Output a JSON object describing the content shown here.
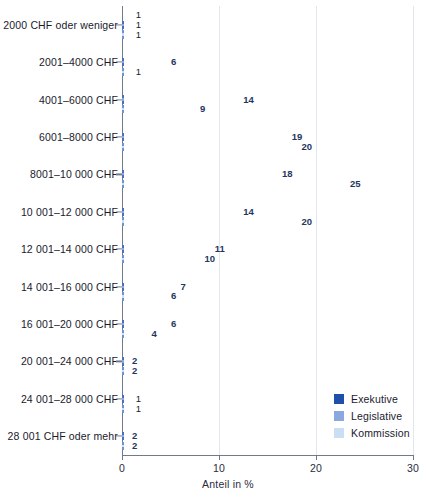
{
  "chart_data": {
    "type": "bar",
    "orientation": "horizontal",
    "title": "",
    "xlabel": "Anteil in %",
    "ylabel": "",
    "xlim": [
      0,
      30
    ],
    "xticks": [
      0,
      10,
      20,
      30
    ],
    "xtick_labels": [
      "0",
      "10",
      "20",
      "30"
    ],
    "grid": true,
    "legend_position": "bottom-right",
    "categories": [
      "2000 CHF oder weniger",
      "2001–4000 CHF",
      "4001–6000 CHF",
      "6001–8000 CHF",
      "8001–10 000 CHF",
      "10 001–12 000 CHF",
      "12 001–14 000 CHF",
      "14 001–16 000 CHF",
      "16 001–20 000 CHF",
      "20 001–24 000 CHF",
      "24 001–28 000 CHF",
      "28 001 CHF oder mehr"
    ],
    "series": [
      {
        "name": "Exekutive",
        "color": "#1f4fa8",
        "values": [
          1,
          2,
          10,
          14,
          23,
          20,
          10,
          8,
          7,
          2,
          2,
          3
        ]
      },
      {
        "name": "Legislative",
        "color": "#8aa8de",
        "values": [
          1,
          6,
          14,
          19,
          18,
          14,
          11,
          7,
          6,
          2,
          1,
          2
        ]
      },
      {
        "name": "Kommission",
        "color": "#cbdff4",
        "values": [
          1,
          1,
          9,
          20,
          25,
          20,
          10,
          6,
          4,
          2,
          1,
          2
        ]
      }
    ]
  },
  "legend": {
    "items": [
      {
        "label": "Exekutive",
        "color": "#1f4fa8"
      },
      {
        "label": "Legislative",
        "color": "#8aa8de"
      },
      {
        "label": "Kommission",
        "color": "#cbdff4"
      }
    ]
  },
  "axis": {
    "x_title": "Anteil in %"
  }
}
